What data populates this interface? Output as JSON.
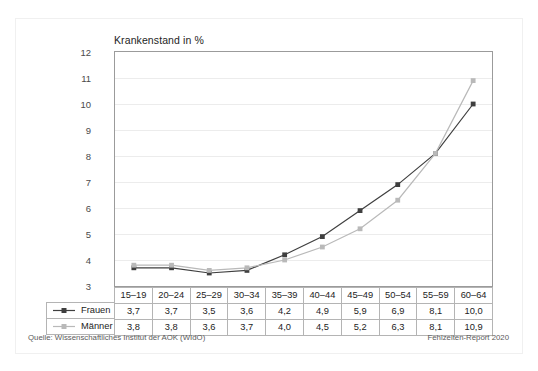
{
  "chart_data": {
    "type": "line",
    "title": "Krankenstand in %",
    "xlabel": "",
    "ylabel": "",
    "categories": [
      "15–19",
      "20–24",
      "25–29",
      "30–34",
      "35–39",
      "40–44",
      "45–49",
      "50–54",
      "55–59",
      "60–64"
    ],
    "ylim": [
      3,
      12
    ],
    "yticks": [
      3,
      4,
      5,
      6,
      7,
      8,
      9,
      10,
      11,
      12
    ],
    "ytick_labels": [
      "3",
      "4",
      "5",
      "6",
      "7",
      "8",
      "9",
      "10",
      "11",
      "12"
    ],
    "grid": true,
    "legend_position": "bottom-left",
    "series": [
      {
        "name": "Frauen",
        "color": "#3f3f3f",
        "marker": "square",
        "values": [
          3.7,
          3.7,
          3.5,
          3.6,
          4.2,
          4.9,
          5.9,
          6.9,
          8.1,
          10.0
        ],
        "labels": [
          "3,7",
          "3,7",
          "3,5",
          "3,6",
          "4,2",
          "4,9",
          "5,9",
          "6,9",
          "8,1",
          "10,0"
        ]
      },
      {
        "name": "Männer",
        "color": "#b9b9b9",
        "marker": "square",
        "values": [
          3.8,
          3.8,
          3.6,
          3.7,
          4.0,
          4.5,
          5.2,
          6.3,
          8.1,
          10.9
        ],
        "labels": [
          "3,8",
          "3,8",
          "3,6",
          "3,7",
          "4,0",
          "4,5",
          "5,2",
          "6,3",
          "8,1",
          "10,9"
        ]
      }
    ]
  },
  "footer": {
    "source": "Quelle: Wissenschaftliches Institut der AOK (WIdO)",
    "report": "Fehlzeiten-Report 2020"
  }
}
